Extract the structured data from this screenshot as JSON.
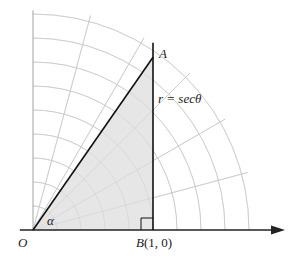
{
  "diagram": {
    "type": "polar-grid-geometry",
    "labels": {
      "origin": "O",
      "point_a": "A",
      "point_b_name": "B",
      "point_b_coords": "(1, 0)",
      "curve": "r = secθ",
      "angle": "α"
    },
    "geometry": {
      "unit": 1,
      "point_b": [
        1,
        0
      ],
      "tan_alpha": 1.44,
      "vertical_line_top": 1.56,
      "grid_circle_step": 0.2,
      "grid_circle_count": 9,
      "grid_radial_step_deg": 15,
      "grid_radial_max_r": 1.85,
      "x_axis_range": [
        -0.11,
        2.1
      ],
      "y_axis_range": [
        0,
        1.83
      ]
    },
    "colors": {
      "grid": "#c8c8c8",
      "shade": "#e6e6e6",
      "line": "#111111",
      "axis": "#222222",
      "y_axis": "#999999"
    }
  }
}
